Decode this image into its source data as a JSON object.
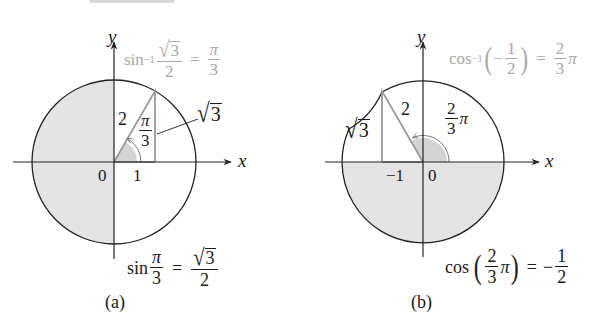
{
  "figure": {
    "panels": [
      {
        "id": "a",
        "caption": "(a)",
        "axis_x": "x",
        "axis_y": "y",
        "origin_label": "0",
        "tick_label": "1",
        "hypotenuse_label": "2",
        "angle_num": "π",
        "angle_den": "3",
        "side_label_radical": "√",
        "side_label_arg": "3",
        "inverse_eq": {
          "fn": "sin",
          "sup": "−1",
          "num_rad": "√",
          "num_arg": "3",
          "den": "2",
          "eq": "=",
          "rhs_num": "π",
          "rhs_den": "3"
        },
        "forward_eq": {
          "fn": "sin",
          "arg_num": "π",
          "arg_den": "3",
          "eq": "=",
          "rhs_rad": "√",
          "rhs_arg": "3",
          "rhs_den": "2"
        },
        "shaded_region": "left half (quadrants II and III)"
      },
      {
        "id": "b",
        "caption": "(b)",
        "axis_x": "x",
        "axis_y": "y",
        "origin_label": "0",
        "tick_label": "−1",
        "hypotenuse_label": "2",
        "angle_num": "2",
        "angle_den": "3",
        "angle_suffix": "π",
        "side_label_radical": "√",
        "side_label_arg": "3",
        "inverse_eq": {
          "fn": "cos",
          "sup": "−1",
          "lparen": "(",
          "neg": "−",
          "num": "1",
          "den": "2",
          "rparen": ")",
          "eq": "=",
          "rhs_num": "2",
          "rhs_den": "3",
          "rhs_suffix": "π"
        },
        "forward_eq": {
          "fn": "cos",
          "lparen": "(",
          "arg_num": "2",
          "arg_den": "3",
          "arg_suffix": "π",
          "rparen": ")",
          "eq": "=",
          "rhs_neg": "−",
          "rhs_num": "1",
          "rhs_den": "2"
        },
        "shaded_region": "lower half (quadrants III and IV)"
      }
    ],
    "colors": {
      "line": "#222222",
      "triangle": "#9a9a9a",
      "shade": "#e4e4e4",
      "angle_fill": "#cfcfcf",
      "muted_text": "#a8a8a8"
    }
  }
}
